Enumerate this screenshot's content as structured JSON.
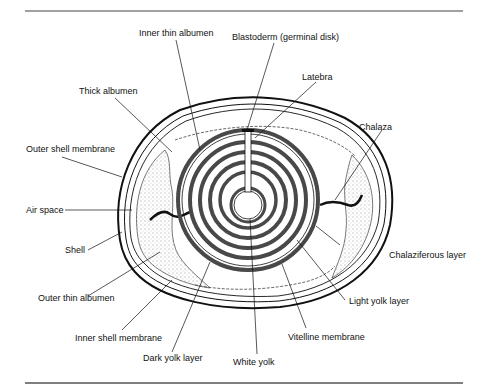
{
  "figure": {
    "labels": {
      "inner_thin_albumen": "Inner thin albumen",
      "blastoderm": "Blastoderm (germinal disk)",
      "latebra": "Latebra",
      "thick_albumen": "Thick albumen",
      "chalaza": "Chalaza",
      "outer_shell_membrane": "Outer shell membrane",
      "air_space": "Air space",
      "shell": "Shell",
      "chalaziferous_layer": "Chalaziferous layer",
      "outer_thin_albumen": "Outer thin albumen",
      "light_yolk_layer": "Light yolk layer",
      "inner_shell_membrane": "Inner shell membrane",
      "vitelline_membrane": "Vitelline membrane",
      "dark_yolk_layer": "Dark yolk layer",
      "white_yolk": "White yolk"
    }
  }
}
